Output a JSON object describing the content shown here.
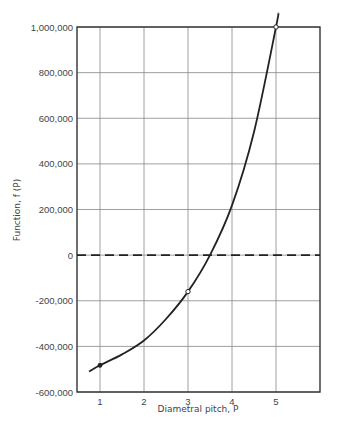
{
  "chart_data": {
    "type": "line",
    "title": "",
    "xlabel": "Diametral pitch, P",
    "ylabel": "Function, f (P)",
    "xlim": [
      0.48,
      6.0
    ],
    "ylim": [
      -600000,
      1000000
    ],
    "x_ticks": [
      1,
      2,
      3,
      4,
      5
    ],
    "x_tick_labels": [
      "1",
      "2",
      "3",
      "4",
      "5"
    ],
    "y_ticks": [
      -600000,
      -400000,
      -200000,
      0,
      200000,
      400000,
      600000,
      800000,
      1000000
    ],
    "y_tick_labels": [
      "-600,000",
      "-400,000",
      "-200,000",
      "0",
      "200,000",
      "400,000",
      "600,000",
      "800,000",
      "1,000,000"
    ],
    "grid": true,
    "series": [
      {
        "name": "f(P)",
        "style": "solid",
        "x": [
          0.75,
          1,
          1.5,
          2,
          2.5,
          3,
          3.5,
          4,
          4.5,
          5,
          5.05
        ],
        "values": [
          -510000,
          -483000,
          -435000,
          -374000,
          -280000,
          -160000,
          0,
          218000,
          540000,
          1000000,
          1060000
        ]
      },
      {
        "name": "zero line",
        "style": "dashed",
        "x": [
          0.48,
          6.0
        ],
        "values": [
          0,
          0
        ]
      }
    ],
    "markers": [
      {
        "x": 1,
        "y": -483000,
        "shape": "dot"
      },
      {
        "x": 3,
        "y": -160000,
        "shape": "open-circle"
      },
      {
        "x": 5,
        "y": 1000000,
        "shape": "open-circle"
      }
    ]
  }
}
